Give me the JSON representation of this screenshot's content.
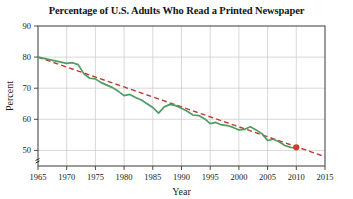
{
  "chart_data": {
    "type": "line",
    "title": "Percentage of U.S. Adults Who Read a Printed Newspaper",
    "xlabel": "Year",
    "ylabel": "Percent",
    "xlim": [
      1965,
      2015
    ],
    "ylim": [
      45,
      90
    ],
    "yticks": [
      50,
      60,
      70,
      80,
      90
    ],
    "xticks": [
      1965,
      1970,
      1975,
      1980,
      1985,
      1990,
      1995,
      2000,
      2005,
      2010,
      2015
    ],
    "grid": true,
    "legend": "none",
    "y_axis_break": true,
    "series": [
      {
        "name": "Percent of U.S. adults who read a printed newspaper",
        "style": "solid",
        "color": "#4f9b63",
        "x": [
          1965,
          1966,
          1967,
          1968,
          1969,
          1970,
          1971,
          1972,
          1973,
          1974,
          1975,
          1976,
          1977,
          1978,
          1979,
          1980,
          1981,
          1982,
          1983,
          1984,
          1985,
          1986,
          1987,
          1988,
          1989,
          1990,
          1991,
          1992,
          1993,
          1994,
          1995,
          1996,
          1997,
          1998,
          1999,
          2000,
          2001,
          2002,
          2003,
          2004,
          2005,
          2006,
          2007,
          2008,
          2009,
          2010
        ],
        "values": [
          80.0,
          79.6,
          79.2,
          78.8,
          78.4,
          78.0,
          78.2,
          77.6,
          74.6,
          73.2,
          73.0,
          71.8,
          71.0,
          70.2,
          69.0,
          67.6,
          68.0,
          67.0,
          66.2,
          65.0,
          63.8,
          62.0,
          64.0,
          64.8,
          64.4,
          63.6,
          62.6,
          61.4,
          61.2,
          60.2,
          58.6,
          59.0,
          58.2,
          58.0,
          57.4,
          56.6,
          56.8,
          57.6,
          56.6,
          55.4,
          53.2,
          53.6,
          52.8,
          51.6,
          51.0,
          50.8
        ]
      },
      {
        "name": "Linear trend line",
        "style": "dashed",
        "color": "#c0392b",
        "x": [
          1965,
          2015
        ],
        "values": [
          80.0,
          48.0
        ]
      }
    ],
    "markers": [
      {
        "name": "trend-endpoint-marker",
        "x": 2010,
        "y": 51.0,
        "color": "#d03b2e",
        "shape": "circle"
      }
    ]
  },
  "axes": {
    "y_tick_labels": [
      "90",
      "80",
      "70",
      "60",
      "50"
    ],
    "x_tick_labels": [
      "1965",
      "1970",
      "1975",
      "1980",
      "1985",
      "1990",
      "1995",
      "2000",
      "2005",
      "2010",
      "2015"
    ],
    "x_axis_title": "Year",
    "y_axis_title": "Percent"
  },
  "colors": {
    "series_green": "#4f9b63",
    "trend_red": "#c0392b",
    "marker_red": "#d03b2e",
    "grid": "#c9c9c9",
    "frame": "#4a4a4a",
    "text": "#1a1a1a",
    "background": "#ffffff"
  }
}
